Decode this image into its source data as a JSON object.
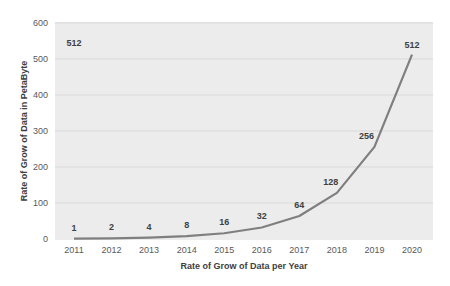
{
  "chart_data": {
    "type": "line",
    "title": "",
    "xlabel": "Rate of Grow of Data per Year",
    "ylabel": "Rate of Grow of Data in PetaByte",
    "categories": [
      "2011",
      "2012",
      "2013",
      "2014",
      "2015",
      "2016",
      "2017",
      "2018",
      "2019",
      "2020"
    ],
    "series": [
      {
        "name": "Data growth",
        "values": [
          1,
          2,
          4,
          8,
          16,
          32,
          64,
          128,
          256,
          512
        ]
      }
    ],
    "data_labels": [
      "1",
      "2",
      "4",
      "8",
      "16",
      "32",
      "64",
      "128",
      "256",
      "512"
    ],
    "extra_annotation": "512",
    "ylim": [
      0,
      600
    ],
    "yticks": [
      0,
      100,
      200,
      300,
      400,
      500,
      600
    ],
    "grid": true,
    "legend": "none",
    "colors": {
      "line": "#7f7f7f",
      "plot_bg": "#ececec",
      "grid": "#d9d9d9"
    }
  }
}
